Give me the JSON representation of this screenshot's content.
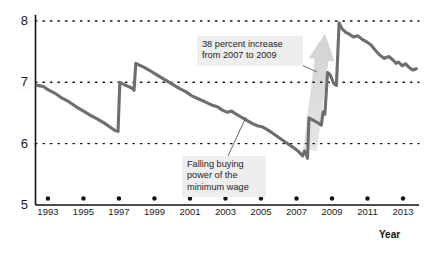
{
  "chart_data": {
    "type": "line",
    "title": "",
    "xlabel": "Year",
    "ylabel": "",
    "xlim": [
      1992.3,
      2013.9
    ],
    "ylim": [
      5,
      8
    ],
    "grid": true,
    "gridlines_y": [
      6,
      7,
      8
    ],
    "y_ticklabels": [
      "8",
      "7",
      "6",
      "5"
    ],
    "y_tickvalues": [
      8,
      7,
      6,
      5
    ],
    "x_ticklabels": [
      "1993",
      "1995",
      "1997",
      "1999",
      "2001",
      "2003",
      "2005",
      "2007",
      "2009",
      "2011",
      "2013"
    ],
    "x_tickvalues": [
      1993,
      1995,
      1997,
      1999,
      2001,
      2003,
      2005,
      2007,
      2009,
      2011,
      2013
    ],
    "legend": [],
    "line_color": "#6e6e6e",
    "series": [
      {
        "name": "Real minimum wage",
        "x": [
          1992.4,
          1992.75,
          1993.0,
          1993.4,
          1993.8,
          1994.2,
          1994.6,
          1995.0,
          1995.4,
          1995.8,
          1996.2,
          1996.55,
          1996.8,
          1996.95,
          1997.05,
          1997.3,
          1997.55,
          1997.75,
          1997.85,
          1997.95,
          1998.15,
          1998.45,
          1998.8,
          1999.2,
          1999.6,
          2000.0,
          2000.4,
          2000.8,
          2001.1,
          2001.4,
          2001.7,
          2002.0,
          2002.3,
          2002.55,
          2002.8,
          2003.1,
          2003.35,
          2003.6,
          2003.9,
          2004.2,
          2004.5,
          2004.8,
          2005.1,
          2005.4,
          2005.7,
          2006.0,
          2006.3,
          2006.6,
          2006.9,
          2007.15,
          2007.35,
          2007.45,
          2007.55,
          2007.62,
          2007.7,
          2007.95,
          2008.2,
          2008.4,
          2008.5,
          2008.6,
          2008.75,
          2008.9,
          2009.0,
          2009.1,
          2009.25,
          2009.4,
          2009.55,
          2009.75,
          2009.95,
          2010.2,
          2010.45,
          2010.7,
          2010.95,
          2011.2,
          2011.45,
          2011.7,
          2011.95,
          2012.2,
          2012.45,
          2012.6,
          2012.75,
          2012.95,
          2013.15,
          2013.35,
          2013.55,
          2013.75
        ],
        "y": [
          6.95,
          6.93,
          6.88,
          6.82,
          6.74,
          6.68,
          6.6,
          6.53,
          6.46,
          6.4,
          6.33,
          6.26,
          6.21,
          6.2,
          7.0,
          6.96,
          6.93,
          6.9,
          6.87,
          7.31,
          7.28,
          7.24,
          7.18,
          7.11,
          7.04,
          6.97,
          6.9,
          6.84,
          6.78,
          6.74,
          6.7,
          6.66,
          6.62,
          6.6,
          6.55,
          6.51,
          6.53,
          6.48,
          6.43,
          6.38,
          6.33,
          6.29,
          6.27,
          6.22,
          6.16,
          6.1,
          6.04,
          5.98,
          5.92,
          5.86,
          5.8,
          5.88,
          5.83,
          5.76,
          6.42,
          6.38,
          6.34,
          6.3,
          6.52,
          6.48,
          7.16,
          7.12,
          7.05,
          6.98,
          6.95,
          7.97,
          7.88,
          7.82,
          7.79,
          7.74,
          7.76,
          7.7,
          7.66,
          7.61,
          7.52,
          7.44,
          7.39,
          7.42,
          7.36,
          7.31,
          7.33,
          7.27,
          7.3,
          7.24,
          7.2,
          7.22
        ]
      }
    ],
    "annotations": [
      {
        "id": "increase-callout",
        "text": "38 percent increase\nfrom 2007 to 2009",
        "box_x": 197,
        "box_y": 36,
        "box_w": 96,
        "leader": [
          291,
          60,
          317,
          72
        ]
      },
      {
        "id": "falling-power-callout",
        "text": "Falling buying\npower of the\nminimum wage",
        "box_x": 182,
        "box_y": 156,
        "box_w": 74,
        "leader": [
          228,
          156,
          246,
          117
        ]
      }
    ],
    "shaded_arrow": {
      "id": "growth-arrow",
      "color": "#dedede",
      "from_x": 310,
      "from_y": 150,
      "to_x": 325,
      "to_y": 34
    }
  },
  "axes": {
    "year_axis_title": "Year"
  }
}
